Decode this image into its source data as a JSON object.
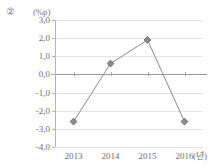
{
  "figure": {
    "item_marker": "②",
    "unit_label": "(%p)",
    "x_unit_label": "(년)"
  },
  "style": {
    "line_color": "#8a8a8a",
    "marker_fill": "#8c8c8c",
    "marker_stroke": "#5d5d5d",
    "gridline_color": "#e4e4e4",
    "zero_line_color": "#9a9a9a",
    "axis_color": "#b4b4b4",
    "text_color": "#6e6e6e",
    "background": "#ffffff"
  },
  "chart_data": {
    "type": "line",
    "title": "",
    "xlabel": "(년)",
    "ylabel": "(%p)",
    "categories": [
      "2013",
      "2014",
      "2015",
      "2016"
    ],
    "values": [
      -2.6,
      0.6,
      1.9,
      -2.6
    ],
    "series": [
      {
        "name": "",
        "values": [
          -2.6,
          0.6,
          1.9,
          -2.6
        ]
      }
    ],
    "ylim": [
      -4.0,
      3.0
    ],
    "ytick_labels": [
      "3,0",
      "2,0",
      "1,0",
      "0,0",
      "-1,0",
      "-2,0",
      "-3,0",
      "-4,0"
    ],
    "ytick_values": [
      3.0,
      2.0,
      1.0,
      0.0,
      -1.0,
      -2.0,
      -3.0,
      -4.0
    ],
    "xtick_labels": [
      "2013",
      "2014",
      "2015",
      "2016"
    ],
    "grid": true,
    "legend": "none",
    "marker": "diamond"
  }
}
